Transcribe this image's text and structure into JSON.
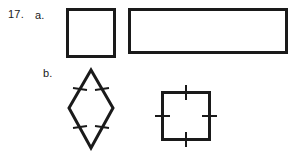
{
  "page": {
    "background_color": "#ffffff",
    "ink_color": "#1a1a1a",
    "width": 297,
    "height": 151
  },
  "problem": {
    "number_label": "17.",
    "parts": [
      {
        "key": "a",
        "label": "a.",
        "shapes": [
          {
            "id": "square-plain",
            "name": "square",
            "tick_marks": 0,
            "stroke_color": "#1a1a1a",
            "stroke_width": 3,
            "fill": "none",
            "width": 49,
            "height": 49
          },
          {
            "id": "rectangle",
            "name": "rectangle",
            "tick_marks": 0,
            "stroke_color": "#1a1a1a",
            "stroke_width": 3,
            "fill": "none",
            "width": 160,
            "height": 46
          }
        ]
      },
      {
        "key": "b",
        "label": "b.",
        "shapes": [
          {
            "id": "rhombus",
            "name": "rhombus",
            "tick_marks": 4,
            "tick_marks_per_side": 1,
            "stroke_color": "#1a1a1a",
            "stroke_width": 3,
            "fill": "none",
            "width": 42,
            "height": 80
          },
          {
            "id": "square-ticked",
            "name": "square",
            "tick_marks": 4,
            "tick_marks_per_side": 1,
            "stroke_color": "#1a1a1a",
            "stroke_width": 3,
            "fill": "none",
            "width": 50,
            "height": 50
          }
        ]
      }
    ]
  }
}
